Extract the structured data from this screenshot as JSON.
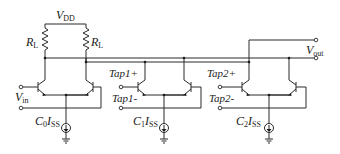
{
  "diagram": {
    "type": "circuit-schematic",
    "supply": {
      "label": "V",
      "sub": "DD"
    },
    "loads": [
      {
        "label": "R",
        "sub": "L"
      },
      {
        "label": "R",
        "sub": "L"
      }
    ],
    "input": {
      "label": "V",
      "sub": "in"
    },
    "output": {
      "label": "V",
      "sub": "out"
    },
    "stages": [
      {
        "name": "stage-0",
        "pos_label": "",
        "neg_label": "",
        "current": {
          "coef": "C",
          "coef_sub": "0",
          "label": "I",
          "sub": "SS"
        }
      },
      {
        "name": "stage-1",
        "pos_label": "Tap1+",
        "neg_label": "Tap1-",
        "current": {
          "coef": "C",
          "coef_sub": "1",
          "label": "I",
          "sub": "SS"
        }
      },
      {
        "name": "stage-2",
        "pos_label": "Tap2+",
        "neg_label": "Tap2-",
        "current": {
          "coef": "C",
          "coef_sub": "2",
          "label": "I",
          "sub": "SS"
        }
      }
    ],
    "colors": {
      "wire": "#2a2a2a",
      "text": "#1a1a1a",
      "background": "#ffffff"
    }
  }
}
